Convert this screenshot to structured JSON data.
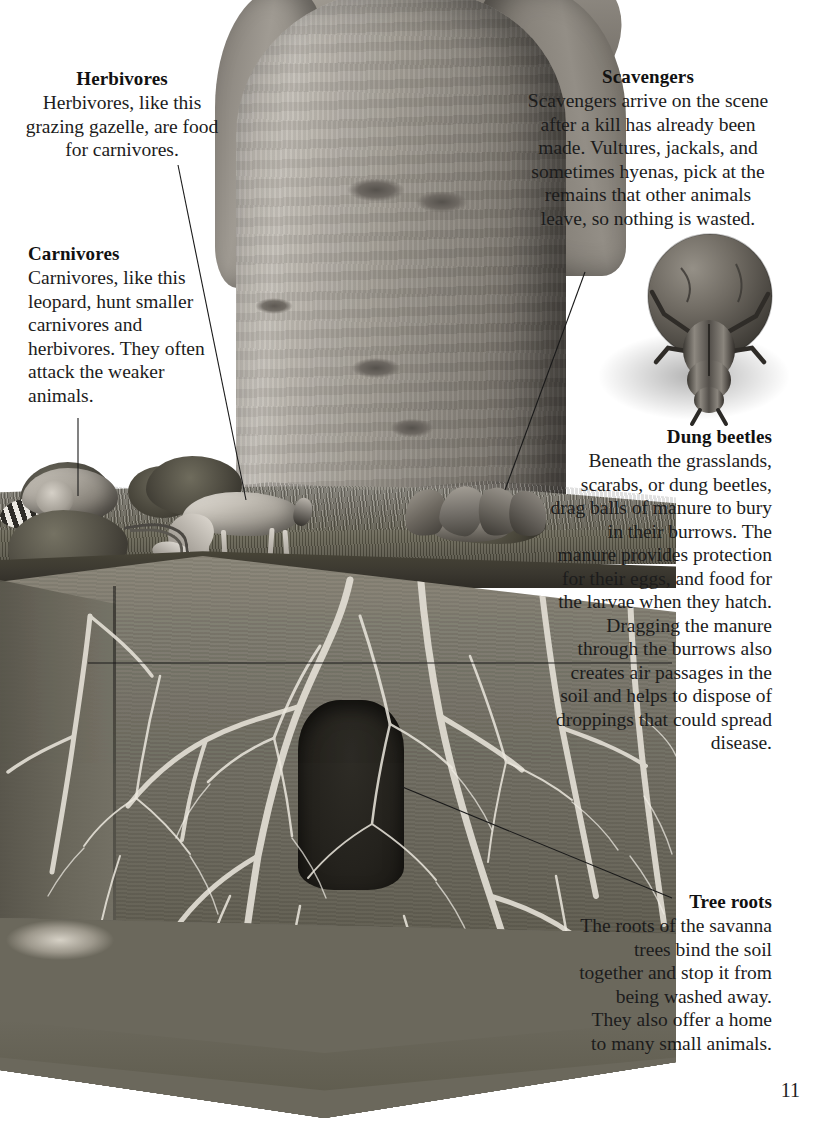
{
  "page": {
    "number": "11",
    "background_color": "#ffffff",
    "text_color": "#1c1c1c"
  },
  "callouts": [
    {
      "id": "herbivores",
      "heading": "Herbivores",
      "body": "Herbivores, like this grazing gazelle, are food for carnivores.",
      "align": "center",
      "points_to": "gazelle"
    },
    {
      "id": "carnivores",
      "heading": "Carnivores",
      "body": "Carnivores, like this leopard, hunt smaller carnivores and herbivores. They often attack the weaker animals.",
      "align": "left",
      "points_to": "leopard"
    },
    {
      "id": "scavengers",
      "heading": "Scavengers",
      "body": "Scavengers arrive on the scene after a kill has already been made. Vultures, jackals, and sometimes hyenas, pick at the remains that other animals leave, so nothing is wasted.",
      "align": "center",
      "points_to": "vultures"
    },
    {
      "id": "dung-beetles",
      "heading": "Dung beetles",
      "body": "Beneath the grasslands, scarabs, or dung beetles, drag balls of manure to bury in their burrows. The manure provides protection for their eggs, and food for the larvae when they hatch. Dragging the manure through the burrows also creates air passages in the soil and helps to dispose of droppings that could spread disease.",
      "align": "right",
      "points_to": "beetle-burrow"
    },
    {
      "id": "tree-roots",
      "heading": "Tree roots",
      "body": "The roots of the savanna trees bind the soil together and stop it from being washed away. They also offer a home to many small animals.",
      "align": "right",
      "points_to": "root-system"
    }
  ],
  "illustration": {
    "description": "Grayscale cutaway illustration of a savanna ecosystem showing a baobab tree trunk above ground and its root system in a soil cross-section below",
    "elements": [
      {
        "name": "baobab-tree-trunk",
        "region": "upper-center"
      },
      {
        "name": "leopard-with-zebra-kill",
        "region": "ground-left"
      },
      {
        "name": "grazing-gazelle",
        "region": "ground-center-left"
      },
      {
        "name": "vultures-feeding",
        "region": "ground-center-right"
      },
      {
        "name": "dung-beetle-with-manure-ball",
        "region": "upper-right"
      },
      {
        "name": "grass-layer",
        "region": "ground-surface"
      },
      {
        "name": "soil-cross-section",
        "region": "below-ground"
      },
      {
        "name": "tree-root-network",
        "region": "below-ground"
      },
      {
        "name": "beetle-burrow",
        "region": "below-ground-center"
      },
      {
        "name": "rock-bedrock-layer",
        "region": "bottom"
      }
    ]
  }
}
